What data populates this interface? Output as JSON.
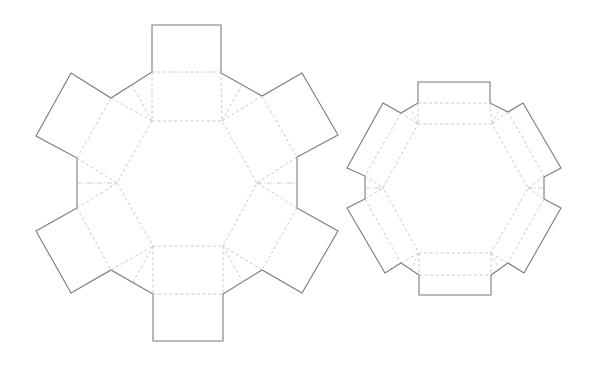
{
  "diagram": {
    "type": "box-dieline",
    "colors": {
      "background": "#ffffff",
      "cut_line": "#7a7a7a",
      "fold_line": "#c4c4c4"
    },
    "legend": {
      "cut": "solid line",
      "fold": "dashed line"
    },
    "templates": [
      {
        "name": "large-hexagon-box",
        "center": [
          187,
          183
        ],
        "tabs": 6
      },
      {
        "name": "small-hexagon-box",
        "center": [
          455,
          188
        ],
        "tabs": 6
      }
    ]
  }
}
